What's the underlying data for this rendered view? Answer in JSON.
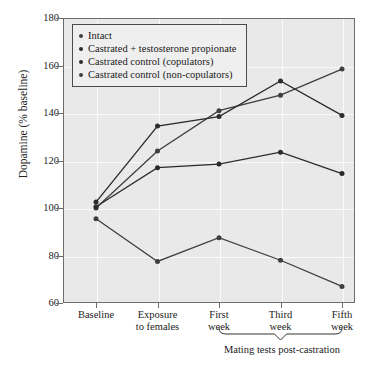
{
  "chart_data": {
    "type": "line",
    "title": "",
    "xlabel": "",
    "ylabel": "Dopamine (% baseline)",
    "ylim": [
      60,
      180
    ],
    "yticks": [
      60,
      80,
      100,
      120,
      140,
      160,
      180
    ],
    "grid": true,
    "legend_position": "top-left",
    "categories": [
      "Baseline",
      "Exposure to females",
      "First week",
      "Third week",
      "Fifth week"
    ],
    "category_lines": [
      [
        "Baseline"
      ],
      [
        "Exposure",
        "to females"
      ],
      [
        "First",
        "week"
      ],
      [
        "Third",
        "week"
      ],
      [
        "Fifth",
        "week"
      ]
    ],
    "series": [
      {
        "name": "Intact",
        "color": "#3f3f3f",
        "values": [
          100.0,
          124.0,
          141.0,
          147.5,
          158.5
        ]
      },
      {
        "name": "Castrated + testosterone propionate",
        "color": "#2b2b2b",
        "values": [
          102.5,
          134.5,
          138.5,
          153.5,
          139.0
        ]
      },
      {
        "name": "Castrated control (copulators)",
        "color": "#2b2b2b",
        "values": [
          100.5,
          117.0,
          118.5,
          123.5,
          114.5
        ]
      },
      {
        "name": "Castrated control (non-copulators)",
        "color": "#3f3f3f",
        "values": [
          95.5,
          77.5,
          87.5,
          78.0,
          67.0
        ]
      }
    ],
    "annotations": [
      {
        "text": "Mating tests post-castration",
        "spans": [
          "First week",
          "Third week",
          "Fifth week"
        ]
      }
    ]
  },
  "legend": {
    "items": [
      "Intact",
      "Castrated + testosterone propionate",
      "Castrated control (copulators)",
      "Castrated control (non-copulators)"
    ]
  },
  "colors": {
    "plot_background": "#e9e9e9",
    "gridline": "#fafafa",
    "axis": "#6d6d6d",
    "text": "#1a1a1a"
  }
}
